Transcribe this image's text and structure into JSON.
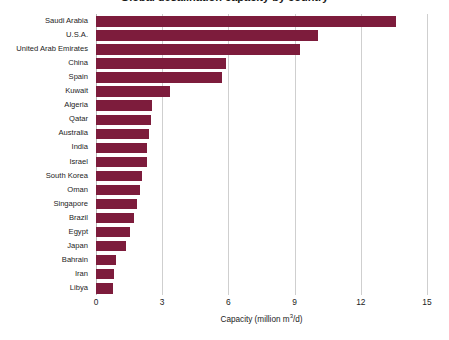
{
  "chart_data": {
    "type": "bar",
    "orientation": "horizontal",
    "title": "Global desalination capacity by country",
    "xlabel": "Capacity (million m³/d)",
    "ylabel": "",
    "xlim": [
      0,
      15
    ],
    "xticks": [
      0,
      3,
      6,
      9,
      12,
      15
    ],
    "xtick_labels": [
      "0",
      "3",
      "6",
      "9",
      "12",
      "15"
    ],
    "grid": "vertical",
    "legend": "none",
    "bar_color": "#7d1c3c",
    "categories": [
      "Saudi Arabia",
      "U.S.A.",
      "United Arab Emirates",
      "China",
      "Spain",
      "Kuwait",
      "Algeria",
      "Qatar",
      "Australia",
      "India",
      "Israel",
      "South Korea",
      "Oman",
      "Singapore",
      "Brazil",
      "Egypt",
      "Japan",
      "Bahrain",
      "Iran",
      "Libya"
    ],
    "values": [
      13.6,
      10.05,
      9.25,
      5.9,
      5.7,
      3.35,
      2.55,
      2.5,
      2.4,
      2.3,
      2.3,
      2.1,
      2.0,
      1.85,
      1.7,
      1.55,
      1.35,
      0.9,
      0.8,
      0.75
    ]
  },
  "axis": {
    "x_title_main": "Capacity (million m",
    "x_title_sup": "3",
    "x_title_tail": "/d)"
  }
}
